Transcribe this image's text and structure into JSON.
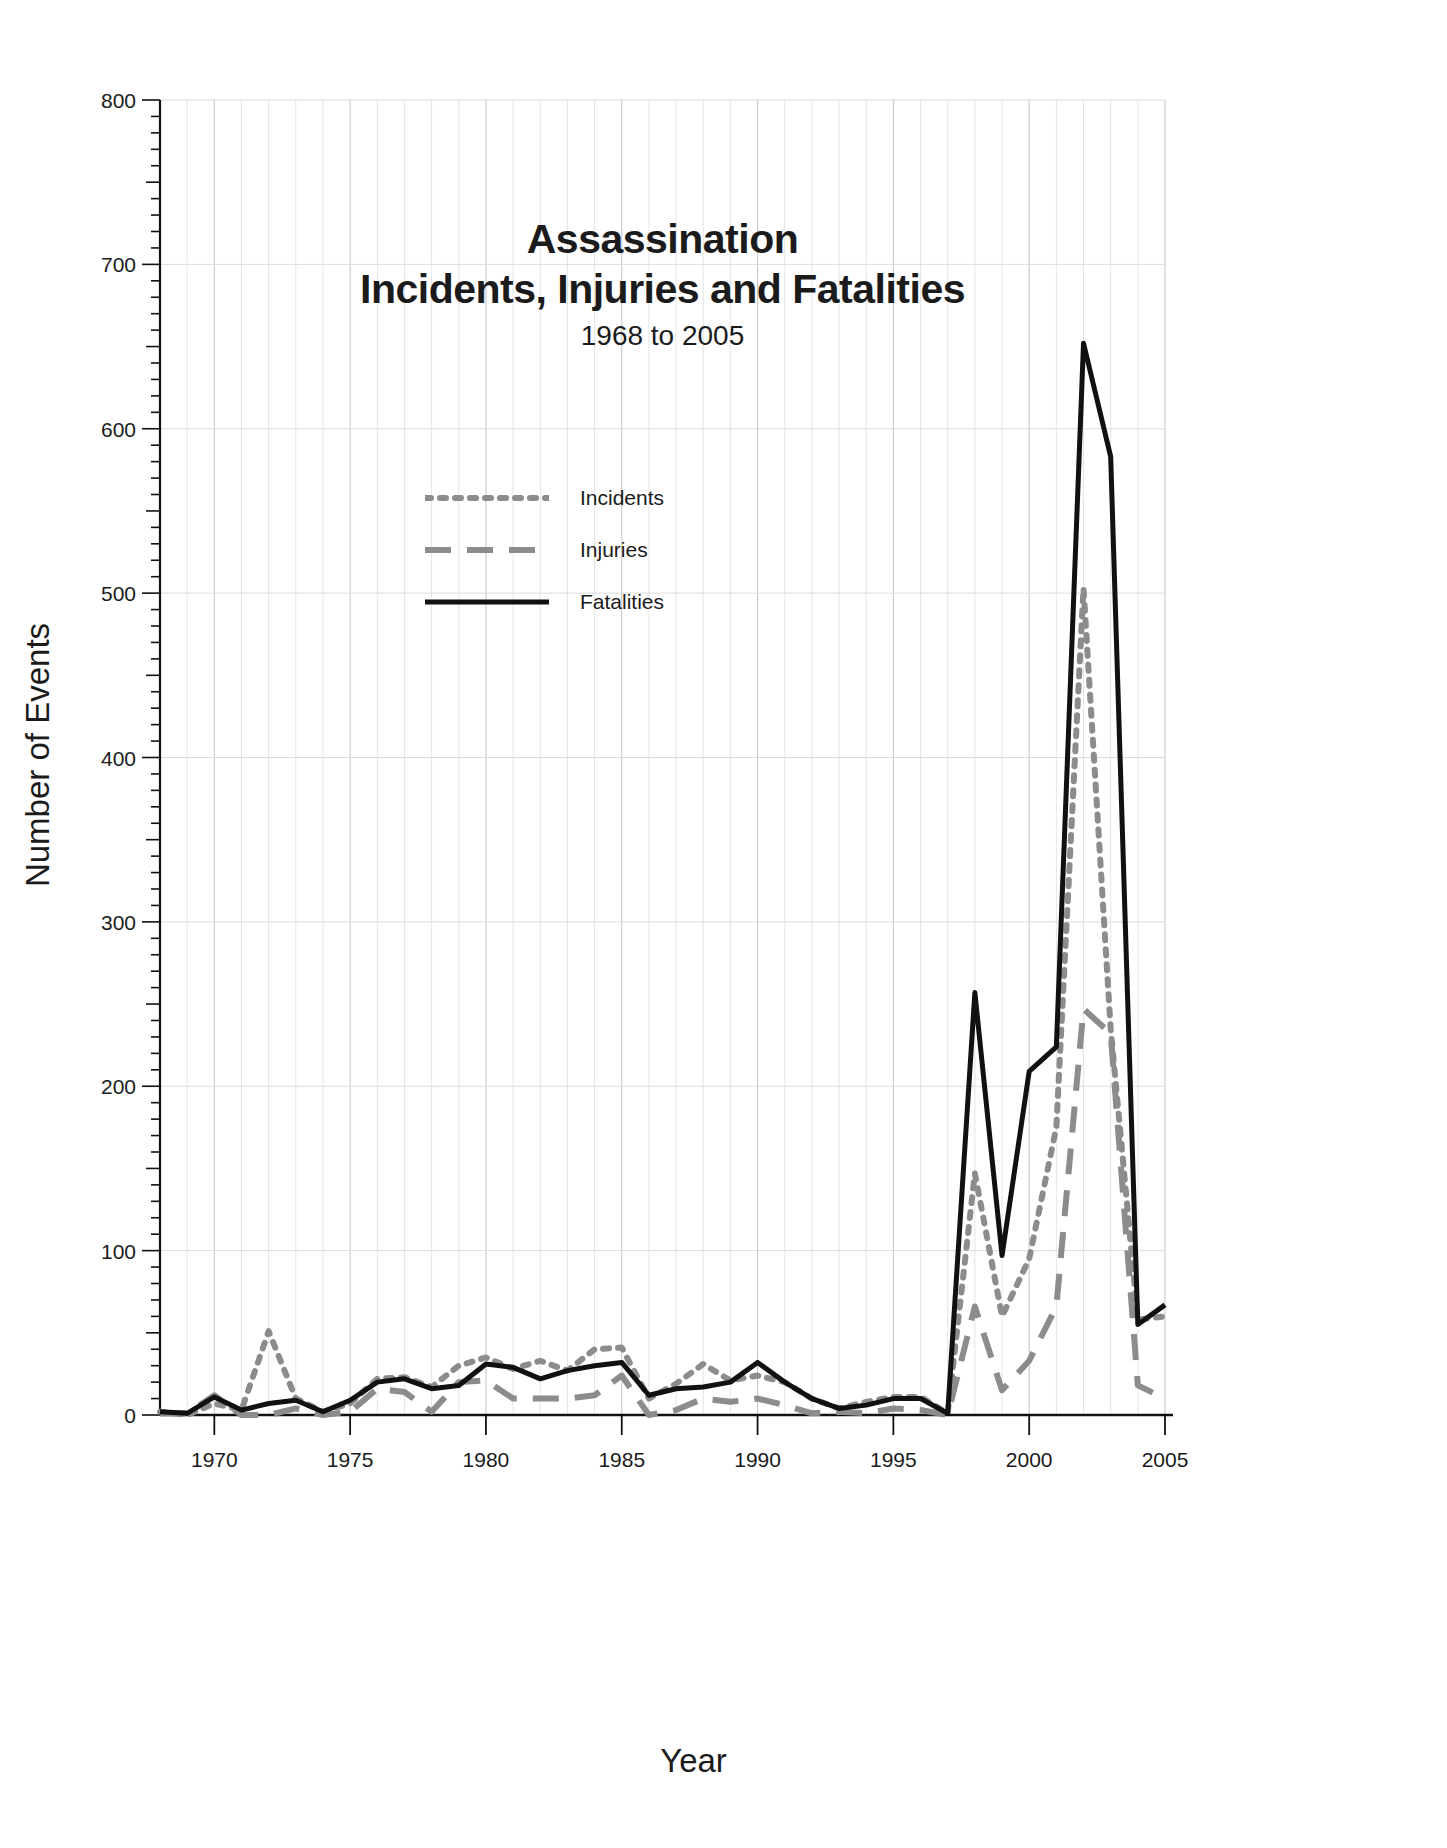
{
  "chart_data": {
    "type": "line",
    "title": "Assassination\nIncidents, Injuries and Fatalities",
    "title_line1": "Assassination",
    "title_line2": "Incidents, Injuries and Fatalities",
    "subtitle": "1968 to 2005",
    "xlabel": "Year",
    "ylabel": "Number of Events",
    "xlim": [
      1968,
      2005
    ],
    "ylim": [
      0,
      800
    ],
    "ytick_step": 100,
    "yminor_step": 10,
    "xtick_step": 5,
    "grid": true,
    "legend_position": "upper-center-left",
    "x": [
      1968,
      1969,
      1970,
      1971,
      1972,
      1973,
      1974,
      1975,
      1976,
      1977,
      1978,
      1979,
      1980,
      1981,
      1982,
      1983,
      1984,
      1985,
      1986,
      1987,
      1988,
      1989,
      1990,
      1991,
      1992,
      1993,
      1994,
      1995,
      1996,
      1997,
      1998,
      1999,
      2000,
      2001,
      2002,
      2003,
      2004,
      2005
    ],
    "xticklabels": [
      "1970",
      "1975",
      "1980",
      "1985",
      "1990",
      "1995",
      "2000",
      "2005"
    ],
    "yticklabels": [
      "0",
      "100",
      "200",
      "300",
      "400",
      "500",
      "600",
      "700",
      "800"
    ],
    "series": [
      {
        "name": "Incidents",
        "style": "dotted",
        "color": "#8c8c8c",
        "values": [
          2,
          0,
          7,
          3,
          51,
          10,
          2,
          7,
          22,
          23,
          17,
          30,
          35,
          28,
          33,
          27,
          40,
          41,
          10,
          19,
          31,
          21,
          24,
          20,
          10,
          4,
          8,
          11,
          11,
          1,
          147,
          60,
          95,
          175,
          503,
          235,
          58,
          60
        ]
      },
      {
        "name": "Injuries",
        "style": "dashed",
        "color": "#8c8c8c",
        "values": [
          1,
          1,
          12,
          0,
          0,
          4,
          0,
          2,
          16,
          14,
          2,
          20,
          21,
          10,
          10,
          10,
          12,
          24,
          0,
          3,
          10,
          8,
          10,
          6,
          1,
          2,
          1,
          4,
          3,
          0,
          66,
          15,
          33,
          66,
          247,
          232,
          18,
          10
        ]
      },
      {
        "name": "Fatalities",
        "style": "solid",
        "color": "#111111",
        "values": [
          2,
          1,
          11,
          3,
          7,
          9,
          2,
          9,
          20,
          22,
          16,
          18,
          31,
          29,
          22,
          27,
          30,
          32,
          12,
          16,
          17,
          20,
          32,
          20,
          10,
          4,
          6,
          10,
          10,
          1,
          257,
          97,
          209,
          224,
          652,
          583,
          55,
          67
        ]
      }
    ]
  }
}
